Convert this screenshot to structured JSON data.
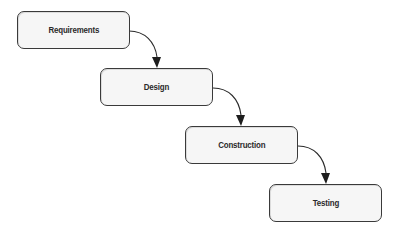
{
  "diagram": {
    "type": "waterfall",
    "steps": [
      {
        "label": "Requirements",
        "x": 17,
        "y": 11
      },
      {
        "label": "Design",
        "x": 100,
        "y": 68
      },
      {
        "label": "Construction",
        "x": 185,
        "y": 126
      },
      {
        "label": "Testing",
        "x": 269,
        "y": 184
      }
    ],
    "connectors": [
      {
        "from": "Requirements",
        "to": "Design"
      },
      {
        "from": "Design",
        "to": "Construction"
      },
      {
        "from": "Construction",
        "to": "Testing"
      }
    ]
  },
  "colors": {
    "box_fill": "#f6f6f6",
    "box_border": "#3a3a3a",
    "arrow": "#2a2a2a",
    "text": "#2a2a2a",
    "background": "#ffffff"
  }
}
